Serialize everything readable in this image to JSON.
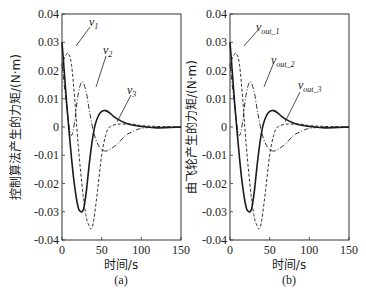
{
  "figure": {
    "panels": [
      {
        "id": "a",
        "caption": "(a)",
        "ylabel": "控制算法产生的力矩/(N·m)",
        "xlabel": "时间/s",
        "series_labels": [
          "v1",
          "v2",
          "v3"
        ],
        "series_label_display": [
          {
            "base": "v",
            "sub": "1"
          },
          {
            "base": "v",
            "sub": "2"
          },
          {
            "base": "v",
            "sub": "3"
          }
        ]
      },
      {
        "id": "b",
        "caption": "(b)",
        "ylabel": "由飞轮产生的力矩/(N·m)",
        "xlabel": "时间/s",
        "series_labels": [
          "vout_1",
          "vout_2",
          "vout_3"
        ],
        "series_label_display": [
          {
            "base": "v",
            "sub": "out_1"
          },
          {
            "base": "v",
            "sub": "out_2"
          },
          {
            "base": "v",
            "sub": "out_3"
          }
        ]
      }
    ],
    "xticks": [
      "0",
      "50",
      "100",
      "150"
    ],
    "yticks": [
      "0.04",
      "0.03",
      "0.02",
      "0.01",
      "0",
      "-0.01",
      "-0.02",
      "-0.03",
      "-0.04"
    ],
    "colors": {
      "line": "#1a1a1a",
      "axis": "#333333",
      "background": "#ffffff"
    }
  },
  "chart_data": [
    {
      "type": "line",
      "title": "(a)",
      "xlabel": "时间/s",
      "ylabel": "控制算法产生的力矩/(N·m)",
      "xlim": [
        0,
        150
      ],
      "ylim": [
        -0.04,
        0.04
      ],
      "xticks": [
        0,
        50,
        100,
        150
      ],
      "yticks": [
        -0.04,
        -0.03,
        -0.02,
        -0.01,
        0,
        0.01,
        0.02,
        0.03,
        0.04
      ],
      "grid": false,
      "legend": "inline annotations with leader lines",
      "series": [
        {
          "name": "v1",
          "style": "dashed",
          "x": [
            0,
            4,
            8,
            12,
            16,
            20,
            25,
            30,
            34,
            37,
            40,
            45,
            50,
            55,
            60,
            70,
            80,
            90,
            100,
            120,
            150
          ],
          "y": [
            0.022,
            0.025,
            0.026,
            0.022,
            0.01,
            -0.005,
            -0.02,
            -0.031,
            -0.035,
            -0.036,
            -0.033,
            -0.022,
            -0.01,
            -0.003,
            0.0,
            0.001,
            0.001,
            0.001,
            0.0005,
            0.0002,
            0.0
          ]
        },
        {
          "name": "v2",
          "style": "dashdot",
          "x": [
            0,
            4,
            8,
            12,
            16,
            20,
            25,
            30,
            35,
            40,
            45,
            50,
            55,
            60,
            70,
            80,
            90,
            100,
            120,
            150
          ],
          "y": [
            0.022,
            0.012,
            0.002,
            -0.003,
            0.002,
            0.011,
            0.016,
            0.013,
            0.005,
            -0.002,
            -0.006,
            -0.008,
            -0.0085,
            -0.008,
            -0.006,
            -0.003,
            -0.0015,
            -0.0005,
            0.0,
            0.0
          ]
        },
        {
          "name": "v3",
          "style": "solid",
          "x": [
            0,
            3,
            6,
            9,
            12,
            15,
            18,
            21,
            24,
            26,
            28,
            31,
            34,
            38,
            42,
            46,
            50,
            55,
            60,
            65,
            70,
            80,
            90,
            100,
            120,
            150
          ],
          "y": [
            0.03,
            0.019,
            0.008,
            -0.002,
            -0.011,
            -0.019,
            -0.025,
            -0.029,
            -0.03,
            -0.0298,
            -0.028,
            -0.022,
            -0.014,
            -0.005,
            0.001,
            0.004,
            0.0055,
            0.0058,
            0.005,
            0.0038,
            0.0028,
            0.0014,
            0.0006,
            0.0002,
            -0.0003,
            0.0
          ]
        }
      ]
    },
    {
      "type": "line",
      "title": "(b)",
      "xlabel": "时间/s",
      "ylabel": "由飞轮产生的力矩/(N·m)",
      "xlim": [
        0,
        150
      ],
      "ylim": [
        -0.04,
        0.04
      ],
      "xticks": [
        0,
        50,
        100,
        150
      ],
      "yticks": [
        -0.04,
        -0.03,
        -0.02,
        -0.01,
        0,
        0.01,
        0.02,
        0.03,
        0.04
      ],
      "grid": false,
      "legend": "inline annotations with leader lines",
      "series": [
        {
          "name": "vout_1",
          "style": "dashed",
          "x": [
            0,
            4,
            8,
            12,
            16,
            20,
            25,
            30,
            34,
            37,
            40,
            45,
            50,
            55,
            60,
            70,
            80,
            90,
            100,
            120,
            150
          ],
          "y": [
            0.022,
            0.025,
            0.026,
            0.022,
            0.01,
            -0.005,
            -0.02,
            -0.031,
            -0.035,
            -0.036,
            -0.033,
            -0.022,
            -0.01,
            -0.003,
            0.0,
            0.001,
            0.001,
            0.001,
            0.0005,
            0.0002,
            0.0
          ]
        },
        {
          "name": "vout_2",
          "style": "dashdot",
          "x": [
            0,
            4,
            8,
            12,
            16,
            20,
            25,
            30,
            35,
            40,
            45,
            50,
            55,
            60,
            70,
            80,
            90,
            100,
            120,
            150
          ],
          "y": [
            0.022,
            0.012,
            0.002,
            -0.003,
            0.002,
            0.011,
            0.016,
            0.013,
            0.005,
            -0.002,
            -0.006,
            -0.008,
            -0.0085,
            -0.008,
            -0.006,
            -0.003,
            -0.0015,
            -0.0005,
            0.0,
            0.0
          ]
        },
        {
          "name": "vout_3",
          "style": "solid",
          "x": [
            0,
            3,
            6,
            9,
            12,
            15,
            18,
            21,
            24,
            26,
            28,
            31,
            34,
            38,
            42,
            46,
            50,
            55,
            60,
            65,
            70,
            80,
            90,
            100,
            120,
            150
          ],
          "y": [
            0.03,
            0.019,
            0.008,
            -0.002,
            -0.011,
            -0.019,
            -0.025,
            -0.029,
            -0.03,
            -0.0298,
            -0.028,
            -0.022,
            -0.014,
            -0.005,
            0.001,
            0.004,
            0.0055,
            0.0058,
            0.005,
            0.0038,
            0.0028,
            0.0014,
            0.0006,
            0.0002,
            -0.0003,
            0.0
          ]
        }
      ]
    }
  ]
}
